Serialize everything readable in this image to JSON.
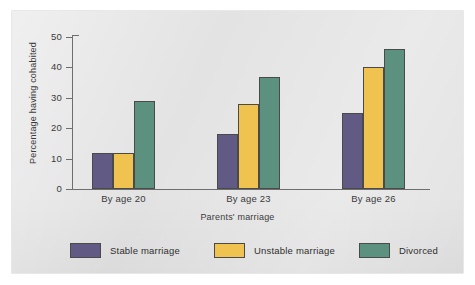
{
  "chart_data": {
    "type": "bar",
    "title": "",
    "xlabel": "Parents' marriage",
    "ylabel": "Percentage having cohabited",
    "categories": [
      "By age 20",
      "By age 23",
      "By age 26"
    ],
    "series": [
      {
        "name": "Stable marriage",
        "color": "#605a85",
        "values": [
          12,
          18,
          25
        ]
      },
      {
        "name": "Unstable marriage",
        "color": "#f0c24f",
        "values": [
          12,
          28,
          40
        ]
      },
      {
        "name": "Divorced",
        "color": "#5c917f",
        "values": [
          29,
          37,
          46
        ]
      }
    ],
    "ylim": [
      0,
      50
    ],
    "yticks": [
      0,
      10,
      20,
      30,
      40,
      50
    ],
    "ytick_labels": [
      "0",
      "10",
      "20",
      "30",
      "40",
      "50"
    ],
    "grid": false,
    "legend_position": "bottom",
    "legend_entries": [
      "Stable marriage",
      "Unstable marriage",
      "Divorced"
    ]
  }
}
